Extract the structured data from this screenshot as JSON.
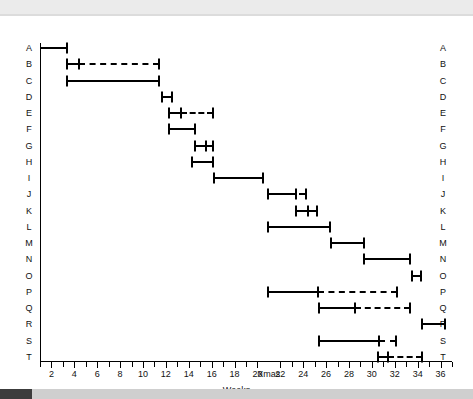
{
  "figure": {
    "x_axis_title": "Weeks",
    "tick_labels": [
      "2",
      "4",
      "6",
      "8",
      "10",
      "12",
      "14",
      "16",
      "18",
      "20",
      "Xmas",
      "22",
      "24",
      "26",
      "28",
      "30",
      "32",
      "34",
      "36"
    ],
    "row_labels": [
      "A",
      "B",
      "C",
      "D",
      "E",
      "F",
      "G",
      "H",
      "I",
      "J",
      "K",
      "L",
      "M",
      "N",
      "O",
      "P",
      "Q",
      "R",
      "S",
      "T"
    ],
    "colors": {
      "ink": "#000000",
      "background": "#ffffff",
      "top_band": "#ebebeb",
      "scrollbar_track": "#cfcfcf",
      "scrollbar_thumb": "#3c3c3c"
    }
  },
  "chart_data": {
    "type": "bar",
    "title": "",
    "subtitle": "",
    "xlabel": "Weeks",
    "ylabel": "",
    "orientation": "horizontal",
    "chart_style": "gantt",
    "grid": false,
    "legend": null,
    "xlim": [
      1,
      37
    ],
    "xticks": [
      2,
      4,
      6,
      8,
      10,
      12,
      14,
      16,
      18,
      20,
      "Xmas",
      22,
      24,
      26,
      28,
      30,
      32,
      34,
      36
    ],
    "x_break": {
      "label": "Xmas",
      "after_week": 20,
      "before_week": 21
    },
    "categories": [
      "A",
      "B",
      "C",
      "D",
      "E",
      "F",
      "G",
      "H",
      "I",
      "J",
      "K",
      "L",
      "M",
      "N",
      "O",
      "P",
      "Q",
      "R",
      "S",
      "T"
    ],
    "tasks": [
      {
        "id": "A",
        "solid_start": 1.0,
        "solid_end": 3.4,
        "dashed_start": null,
        "dashed_end": null
      },
      {
        "id": "B",
        "solid_start": 3.4,
        "solid_end": 4.4,
        "dashed_start": 4.4,
        "dashed_end": 11.4
      },
      {
        "id": "C",
        "solid_start": 3.4,
        "solid_end": 11.4,
        "dashed_start": null,
        "dashed_end": null
      },
      {
        "id": "D",
        "solid_start": 11.7,
        "solid_end": 12.5,
        "dashed_start": null,
        "dashed_end": null
      },
      {
        "id": "E",
        "solid_start": 12.3,
        "solid_end": 13.3,
        "dashed_start": 13.3,
        "dashed_end": 16.1
      },
      {
        "id": "F",
        "solid_start": 12.3,
        "solid_end": 14.5,
        "dashed_start": null,
        "dashed_end": null
      },
      {
        "id": "G",
        "solid_start": 14.5,
        "solid_end": 15.5,
        "dashed_start": 15.5,
        "dashed_end": 16.1
      },
      {
        "id": "H",
        "solid_start": 14.3,
        "solid_end": 16.1,
        "dashed_start": null,
        "dashed_end": null
      },
      {
        "id": "I",
        "solid_start": 16.2,
        "solid_end": 20.5,
        "dashed_start": null,
        "dashed_end": null
      },
      {
        "id": "J",
        "solid_start": 20.9,
        "solid_end": 23.4,
        "dashed_start": 23.6,
        "dashed_end": 24.2
      },
      {
        "id": "K",
        "solid_start": 23.4,
        "solid_end": 24.4,
        "dashed_start": 24.4,
        "dashed_end": 25.2
      },
      {
        "id": "L",
        "solid_start": 20.9,
        "solid_end": 26.3,
        "dashed_start": null,
        "dashed_end": null
      },
      {
        "id": "M",
        "solid_start": 26.4,
        "solid_end": 29.3,
        "dashed_start": null,
        "dashed_end": null
      },
      {
        "id": "N",
        "solid_start": 29.3,
        "solid_end": 33.3,
        "dashed_start": null,
        "dashed_end": null
      },
      {
        "id": "O",
        "solid_start": 33.5,
        "solid_end": 34.3,
        "dashed_start": null,
        "dashed_end": null
      },
      {
        "id": "P",
        "solid_start": 20.9,
        "solid_end": 25.3,
        "dashed_start": 25.3,
        "dashed_end": 32.2
      },
      {
        "id": "Q",
        "solid_start": 25.4,
        "solid_end": 28.5,
        "dashed_start": 28.5,
        "dashed_end": 33.3
      },
      {
        "id": "R",
        "solid_start": 34.4,
        "solid_end": 36.4,
        "dashed_start": null,
        "dashed_end": null
      },
      {
        "id": "S",
        "solid_start": 25.4,
        "solid_end": 30.6,
        "dashed_start": 30.6,
        "dashed_end": 32.1
      },
      {
        "id": "T",
        "solid_start": 30.5,
        "solid_end": 31.4,
        "dashed_start": 31.4,
        "dashed_end": 34.4
      }
    ]
  }
}
